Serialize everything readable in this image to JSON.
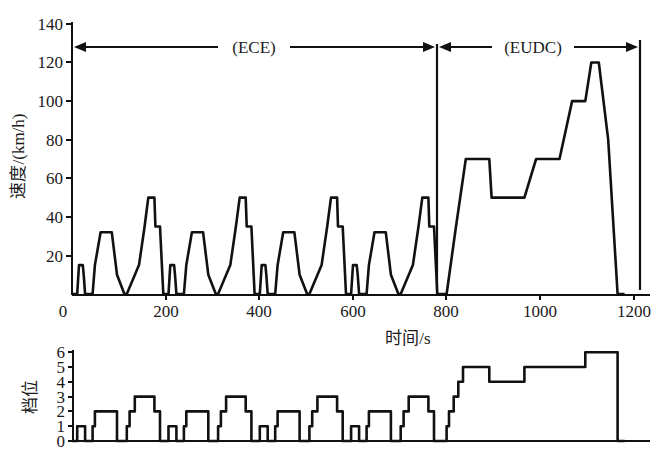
{
  "chart_data": [
    {
      "type": "line",
      "title": "",
      "xlabel": "时间/s",
      "ylabel": "速度/(km/h)",
      "xlim": [
        0,
        1220
      ],
      "ylim": [
        0,
        140
      ],
      "x_ticks": [
        "0",
        "200",
        "400",
        "600",
        "800",
        "1000",
        "1200"
      ],
      "y_ticks": [
        "20",
        "40",
        "60",
        "80",
        "100",
        "120",
        "140"
      ],
      "grid": false,
      "annotations": [
        {
          "text": "(ECE)",
          "x_range": [
            0,
            780
          ],
          "note": "double-headed arrow span"
        },
        {
          "text": "(EUDC)",
          "x_range": [
            780,
            1220
          ],
          "note": "double-headed arrow span"
        }
      ],
      "series": [
        {
          "name": "车速 (vehicle speed)",
          "x": [
            0,
            11,
            15,
            23,
            25,
            28,
            44,
            49,
            61,
            85,
            96,
            112,
            117,
            143,
            155,
            163,
            176,
            178,
            188,
            195,
            206,
            210,
            218,
            220,
            223,
            239,
            244,
            256,
            280,
            291,
            307,
            312,
            338,
            350,
            358,
            371,
            373,
            383,
            390,
            401,
            405,
            413,
            415,
            418,
            434,
            439,
            451,
            475,
            486,
            502,
            507,
            533,
            545,
            553,
            566,
            568,
            578,
            585,
            596,
            600,
            608,
            610,
            613,
            629,
            634,
            646,
            670,
            681,
            697,
            702,
            728,
            740,
            748,
            761,
            763,
            773,
            780,
            800,
            820,
            841,
            891,
            896,
            908,
            966,
            991,
            1041,
            1068,
            1096,
            1109,
            1125,
            1145,
            1165,
            1180
          ],
          "values": [
            0,
            0,
            15,
            15,
            10,
            0,
            0,
            15,
            32,
            32,
            10,
            0,
            0,
            15,
            35,
            50,
            50,
            35,
            35,
            0,
            0,
            15,
            15,
            10,
            0,
            0,
            15,
            32,
            32,
            10,
            0,
            0,
            15,
            35,
            50,
            50,
            35,
            35,
            0,
            0,
            15,
            15,
            10,
            0,
            0,
            15,
            32,
            32,
            10,
            0,
            0,
            15,
            35,
            50,
            50,
            35,
            35,
            0,
            0,
            15,
            15,
            10,
            0,
            0,
            15,
            32,
            32,
            10,
            0,
            0,
            15,
            35,
            50,
            50,
            35,
            35,
            0,
            0,
            35,
            70,
            70,
            50,
            50,
            50,
            70,
            70,
            100,
            100,
            120,
            120,
            80,
            0,
            0
          ]
        }
      ]
    },
    {
      "type": "line",
      "title": "",
      "xlabel": "",
      "ylabel": "档位",
      "xlim": [
        0,
        1220
      ],
      "ylim": [
        0,
        6
      ],
      "y_ticks": [
        "0",
        "1",
        "2",
        "3",
        "4",
        "5",
        "6"
      ],
      "grid": false,
      "series": [
        {
          "name": "档位 (gear)",
          "x": [
            0,
            11,
            11,
            28,
            28,
            44,
            44,
            49,
            49,
            96,
            96,
            117,
            117,
            123,
            123,
            134,
            134,
            176,
            176,
            188,
            188,
            206,
            206,
            223,
            223,
            239,
            239,
            244,
            244,
            291,
            291,
            312,
            312,
            318,
            318,
            329,
            329,
            371,
            371,
            383,
            383,
            401,
            401,
            418,
            418,
            434,
            434,
            439,
            439,
            486,
            486,
            507,
            507,
            513,
            513,
            524,
            524,
            566,
            566,
            578,
            578,
            596,
            596,
            613,
            613,
            629,
            629,
            634,
            634,
            681,
            681,
            702,
            702,
            708,
            708,
            719,
            719,
            761,
            761,
            773,
            773,
            800,
            800,
            805,
            805,
            815,
            815,
            825,
            825,
            835,
            835,
            891,
            891,
            966,
            966,
            1096,
            1096,
            1165,
            1165,
            1180
          ],
          "values": [
            0,
            0,
            1,
            1,
            0,
            0,
            1,
            1,
            2,
            2,
            0,
            0,
            1,
            1,
            2,
            2,
            3,
            3,
            2,
            2,
            0,
            0,
            1,
            1,
            0,
            0,
            1,
            1,
            2,
            2,
            0,
            0,
            1,
            1,
            2,
            2,
            3,
            3,
            2,
            2,
            0,
            0,
            1,
            1,
            0,
            0,
            1,
            1,
            2,
            2,
            0,
            0,
            1,
            1,
            2,
            2,
            3,
            3,
            2,
            2,
            0,
            0,
            1,
            1,
            0,
            0,
            1,
            1,
            2,
            2,
            0,
            0,
            1,
            1,
            2,
            2,
            3,
            3,
            2,
            2,
            0,
            0,
            1,
            1,
            2,
            2,
            3,
            3,
            4,
            4,
            5,
            5,
            4,
            4,
            5,
            5,
            6,
            6,
            0,
            0
          ]
        }
      ]
    }
  ],
  "top_chart": {
    "ylabel": "速度/(km/h)",
    "xlabel": "时间/s",
    "x_ticks": [
      "0",
      "200",
      "400",
      "600",
      "800",
      "1000",
      "1200"
    ],
    "y_ticks": [
      "20",
      "40",
      "60",
      "80",
      "100",
      "120",
      "140"
    ],
    "ece_label": "(ECE)",
    "eudc_label": "(EUDC)"
  },
  "bottom_chart": {
    "ylabel": "档位",
    "y_ticks": [
      "0",
      "1",
      "2",
      "3",
      "4",
      "5",
      "6"
    ]
  },
  "colors": {
    "line": "#111111",
    "background": "#ffffff"
  }
}
